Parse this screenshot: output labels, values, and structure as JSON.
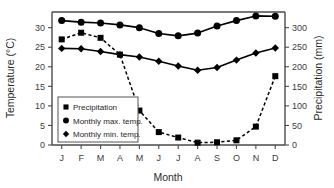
{
  "chart_data": {
    "type": "line",
    "title": "",
    "xlabel": "Month",
    "ylabel": "Temperature (°C)",
    "y2label": "Precipitation (mm)",
    "categories": [
      "J",
      "F",
      "M",
      "A",
      "M",
      "J",
      "J",
      "A",
      "S",
      "O",
      "N",
      "D"
    ],
    "x_tick_labels": [
      "J",
      "F",
      "M",
      "A",
      "M",
      "J",
      "J",
      "A",
      "S",
      "O",
      "N",
      "D"
    ],
    "y_tick_labels": [
      "0",
      "5",
      "10",
      "15",
      "20",
      "25",
      "30"
    ],
    "y_ticks": [
      0,
      5,
      10,
      15,
      20,
      25,
      30
    ],
    "ylim": [
      0,
      34
    ],
    "y2_tick_labels": [
      "0",
      "50",
      "100",
      "150",
      "200",
      "250",
      "300"
    ],
    "y2_ticks": [
      0,
      50,
      100,
      150,
      200,
      250,
      300
    ],
    "y2lim": [
      0,
      340
    ],
    "grid": false,
    "legend_position": "lower-left",
    "series": [
      {
        "name": "Precipitation",
        "axis": "right",
        "marker": "square",
        "linestyle": "dashed",
        "unit": "mm",
        "values": [
          270,
          287,
          274,
          231,
          88,
          33,
          19,
          6,
          7,
          12,
          47,
          176
        ]
      },
      {
        "name": "Monthly max. temp.",
        "axis": "left",
        "marker": "circle",
        "linestyle": "solid",
        "unit": "°C",
        "values": [
          31.8,
          31.4,
          31.2,
          30.7,
          30.0,
          28.5,
          27.9,
          28.6,
          30.4,
          31.8,
          33.0,
          32.9
        ]
      },
      {
        "name": "Monthly min. temp.",
        "axis": "left",
        "marker": "diamond",
        "linestyle": "solid",
        "unit": "°C",
        "values": [
          24.7,
          24.6,
          23.9,
          23.1,
          22.5,
          21.4,
          20.2,
          19.1,
          19.8,
          21.7,
          23.5,
          24.8
        ]
      }
    ],
    "legend_entries": [
      {
        "label": "Precipitation",
        "marker": "square"
      },
      {
        "label": "Monthly max. temp.",
        "marker": "circle"
      },
      {
        "label": "Monthly min. temp.",
        "marker": "diamond"
      }
    ],
    "colors": {
      "series": "#000000",
      "axis": "#4a4a4a",
      "text": "#2b2b2b",
      "background": "#ffffff"
    }
  }
}
